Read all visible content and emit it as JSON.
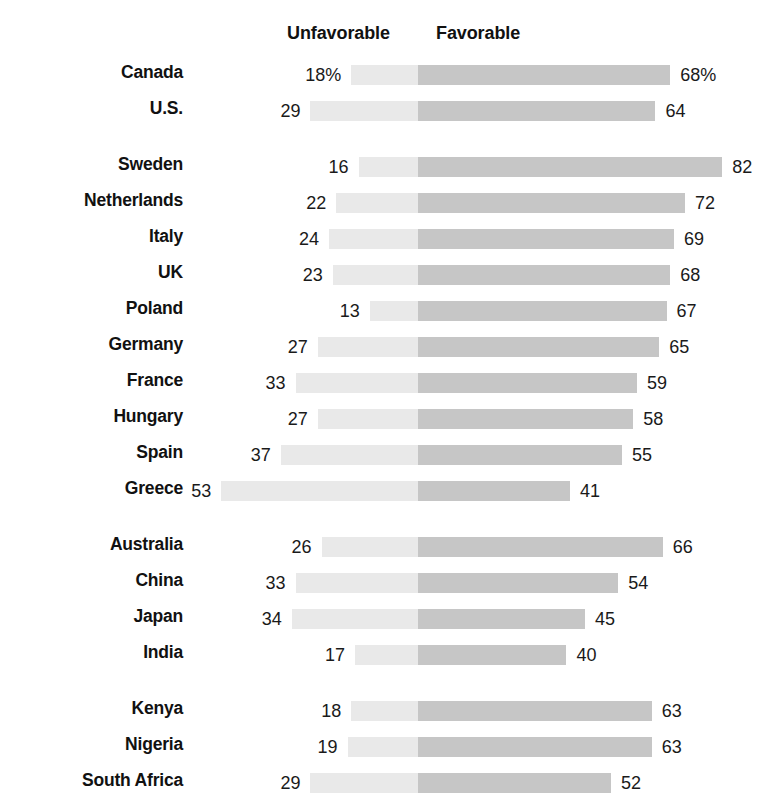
{
  "chart_data": {
    "type": "bar",
    "subtype": "diverging-stacked-bar",
    "title": "",
    "xlabel": "",
    "ylabel": "",
    "legend": [
      "Unfavorable",
      "Favorable"
    ],
    "legend_position": "top",
    "grid": false,
    "axis_center_value": 0,
    "unit_suffix": "%",
    "value_suffix_shown_on_first_row_only": true,
    "categories": [
      "Canada",
      "U.S.",
      "Sweden",
      "Netherlands",
      "Italy",
      "UK",
      "Poland",
      "Germany",
      "France",
      "Hungary",
      "Spain",
      "Greece",
      "Australia",
      "China",
      "Japan",
      "India",
      "Kenya",
      "Nigeria",
      "South Africa"
    ],
    "series": [
      {
        "name": "Unfavorable",
        "color": "#e9e9e9",
        "direction": "left",
        "values": [
          18,
          29,
          16,
          22,
          24,
          23,
          13,
          27,
          33,
          27,
          37,
          53,
          26,
          33,
          34,
          17,
          18,
          19,
          29
        ]
      },
      {
        "name": "Favorable",
        "color": "#c6c6c6",
        "direction": "right",
        "values": [
          68,
          64,
          82,
          72,
          69,
          68,
          67,
          65,
          59,
          58,
          55,
          41,
          66,
          54,
          45,
          40,
          63,
          63,
          52
        ]
      }
    ],
    "groups": [
      {
        "name": "north-america",
        "rows": [
          {
            "country": "Canada",
            "unfavorable": 18,
            "favorable": 68,
            "unfavorable_label": "18%",
            "favorable_label": "68%"
          },
          {
            "country": "U.S.",
            "unfavorable": 29,
            "favorable": 64,
            "unfavorable_label": "29",
            "favorable_label": "64"
          }
        ]
      },
      {
        "name": "europe",
        "rows": [
          {
            "country": "Sweden",
            "unfavorable": 16,
            "favorable": 82,
            "unfavorable_label": "16",
            "favorable_label": "82"
          },
          {
            "country": "Netherlands",
            "unfavorable": 22,
            "favorable": 72,
            "unfavorable_label": "22",
            "favorable_label": "72"
          },
          {
            "country": "Italy",
            "unfavorable": 24,
            "favorable": 69,
            "unfavorable_label": "24",
            "favorable_label": "69"
          },
          {
            "country": "UK",
            "unfavorable": 23,
            "favorable": 68,
            "unfavorable_label": "23",
            "favorable_label": "68"
          },
          {
            "country": "Poland",
            "unfavorable": 13,
            "favorable": 67,
            "unfavorable_label": "13",
            "favorable_label": "67"
          },
          {
            "country": "Germany",
            "unfavorable": 27,
            "favorable": 65,
            "unfavorable_label": "27",
            "favorable_label": "65"
          },
          {
            "country": "France",
            "unfavorable": 33,
            "favorable": 59,
            "unfavorable_label": "33",
            "favorable_label": "59"
          },
          {
            "country": "Hungary",
            "unfavorable": 27,
            "favorable": 58,
            "unfavorable_label": "27",
            "favorable_label": "58"
          },
          {
            "country": "Spain",
            "unfavorable": 37,
            "favorable": 55,
            "unfavorable_label": "37",
            "favorable_label": "55"
          },
          {
            "country": "Greece",
            "unfavorable": 53,
            "favorable": 41,
            "unfavorable_label": "53",
            "favorable_label": "41"
          }
        ]
      },
      {
        "name": "asia-pacific",
        "rows": [
          {
            "country": "Australia",
            "unfavorable": 26,
            "favorable": 66,
            "unfavorable_label": "26",
            "favorable_label": "66"
          },
          {
            "country": "China",
            "unfavorable": 33,
            "favorable": 54,
            "unfavorable_label": "33",
            "favorable_label": "54"
          },
          {
            "country": "Japan",
            "unfavorable": 34,
            "favorable": 45,
            "unfavorable_label": "34",
            "favorable_label": "45"
          },
          {
            "country": "India",
            "unfavorable": 17,
            "favorable": 40,
            "unfavorable_label": "17",
            "favorable_label": "40"
          }
        ]
      },
      {
        "name": "africa",
        "rows": [
          {
            "country": "Kenya",
            "unfavorable": 18,
            "favorable": 63,
            "unfavorable_label": "18",
            "favorable_label": "63"
          },
          {
            "country": "Nigeria",
            "unfavorable": 19,
            "favorable": 63,
            "unfavorable_label": "19",
            "favorable_label": "63"
          },
          {
            "country": "South Africa",
            "unfavorable": 29,
            "favorable": 52,
            "unfavorable_label": "29",
            "favorable_label": "52"
          }
        ]
      }
    ]
  },
  "header": {
    "unfavorable_label": "Unfavorable",
    "favorable_label": "Favorable"
  },
  "colors": {
    "unfavorable": "#e9e9e9",
    "favorable": "#c6c6c6",
    "text": "#111111",
    "background": "#ffffff"
  },
  "layout": {
    "center_x": 418,
    "px_per_unit": 3.71,
    "bar_height": 20,
    "row_pitch": 36,
    "group_gap": 20,
    "label_right_edge": 183
  }
}
